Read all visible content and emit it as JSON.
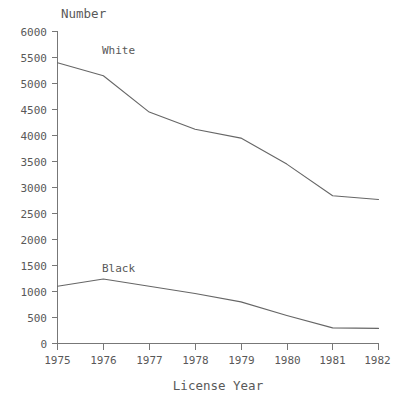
{
  "chart_data": {
    "type": "line",
    "title": "",
    "ylabel": "Number",
    "xlabel": "License Year",
    "x": [
      1975,
      1976,
      1977,
      1978,
      1979,
      1980,
      1981,
      1982
    ],
    "xticklabels": [
      "1975",
      "1976",
      "1977",
      "1978",
      "1979",
      "1980",
      "1981",
      "1982"
    ],
    "yticklabels": [
      "0",
      "500",
      "1000",
      "1500",
      "2000",
      "2500",
      "3000",
      "3500",
      "4000",
      "4500",
      "5000",
      "5500",
      "6000"
    ],
    "yticks": [
      0,
      500,
      1000,
      1500,
      2000,
      2500,
      3000,
      3500,
      4000,
      4500,
      5000,
      5500,
      6000
    ],
    "ylim": [
      0,
      6000
    ],
    "xlim": [
      1975,
      1982
    ],
    "grid": false,
    "legend": "inline-labels",
    "series": [
      {
        "name": "White",
        "label": "White",
        "color": "#666666",
        "values": [
          5400,
          5150,
          4450,
          4120,
          3950,
          3450,
          2840,
          2770
        ]
      },
      {
        "name": "Black",
        "label": "Black",
        "color": "#666666",
        "values": [
          1100,
          1240,
          1100,
          960,
          800,
          540,
          300,
          290
        ]
      }
    ],
    "annotations": [
      {
        "text": "White",
        "x": 1976.0,
        "y": 5620
      },
      {
        "text": "Black",
        "x": 1976.0,
        "y": 1530
      }
    ]
  }
}
